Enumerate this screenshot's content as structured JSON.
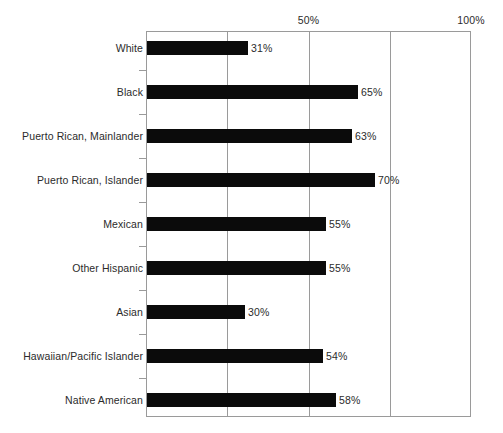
{
  "chart_data": {
    "type": "bar",
    "orientation": "horizontal",
    "title": "",
    "subtitle": "",
    "xlabel": "",
    "ylabel": "",
    "xlim": [
      0,
      100
    ],
    "x_tick_labels": [
      "50%",
      "100%"
    ],
    "x_tick_values": [
      50,
      100
    ],
    "gridlines": [
      25,
      50,
      75
    ],
    "grid": true,
    "legend": null,
    "value_suffix": "%",
    "categories": [
      "White",
      "Black",
      "Puerto Rican, Mainlander",
      "Puerto Rican, Islander",
      "Mexican",
      "Other Hispanic",
      "Asian",
      "Hawaiian/Pacific Islander",
      "Native American"
    ],
    "values": [
      31,
      65,
      63,
      70,
      55,
      55,
      30,
      54,
      58
    ],
    "data_labels": [
      "31%",
      "65%",
      "63%",
      "70%",
      "55%",
      "55%",
      "30%",
      "54%",
      "58%"
    ],
    "bar_color": "#0b0b0b",
    "axis_color": "#9a9a9a",
    "text_color": "#2b2b2b",
    "background_color": "#ffffff"
  }
}
